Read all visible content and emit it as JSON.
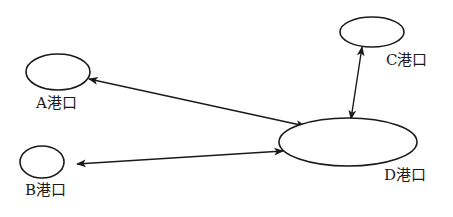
{
  "diagram": {
    "type": "hub-and-spoke port network",
    "stroke_color": "#1a1a1a",
    "background": "#ffffff",
    "nodes": [
      {
        "id": "A",
        "label": "A港口",
        "cx": 58,
        "cy": 72,
        "rx": 32,
        "ry": 18,
        "label_x": 36,
        "label_y": 96
      },
      {
        "id": "B",
        "label": "B港口",
        "cx": 42,
        "cy": 162,
        "rx": 22,
        "ry": 16,
        "label_x": 25,
        "label_y": 183
      },
      {
        "id": "C",
        "label": "C港口",
        "cx": 372,
        "cy": 32,
        "rx": 32,
        "ry": 15,
        "label_x": 386,
        "label_y": 53
      },
      {
        "id": "D",
        "label": "D港口",
        "cx": 348,
        "cy": 142,
        "rx": 69,
        "ry": 24,
        "label_x": 384,
        "label_y": 168
      }
    ],
    "edges": [
      {
        "from": "A",
        "to": "D",
        "direction": "bidirectional",
        "x1": 89,
        "y1": 79,
        "x2": 305,
        "y2": 126
      },
      {
        "from": "B",
        "to": "D",
        "direction": "bidirectional",
        "x1": 77,
        "y1": 164,
        "x2": 283,
        "y2": 151
      },
      {
        "from": "C",
        "to": "D",
        "direction": "bidirectional",
        "x1": 362,
        "y1": 47,
        "x2": 351,
        "y2": 119
      }
    ]
  }
}
